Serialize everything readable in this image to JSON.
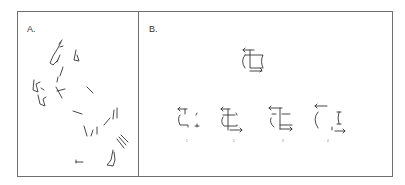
{
  "figure": {
    "panels": [
      {
        "id": "A",
        "label": "A.",
        "content": "fragmented line drawing of a rearing horse"
      },
      {
        "id": "B",
        "label": "B.",
        "content": "target shape with four fragmented answer options",
        "options": [
          "1",
          "2",
          "3",
          "4"
        ]
      }
    ],
    "colors": {
      "line": "#333333",
      "border": "#6e6e6e",
      "background": "#ffffff"
    }
  }
}
